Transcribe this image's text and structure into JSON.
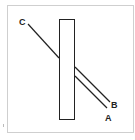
{
  "diagram": {
    "labels": {
      "a": "A",
      "b": "B",
      "c": "C"
    },
    "colors": {
      "frame": "#cfcfcf",
      "stroke": "#222222",
      "background": "#ffffff"
    }
  }
}
